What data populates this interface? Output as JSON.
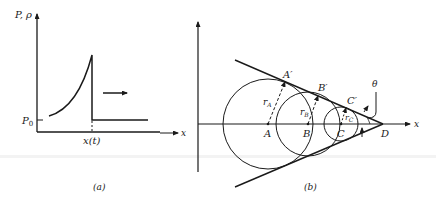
{
  "figure": {
    "panel_a": {
      "caption": "(a)",
      "y_axis_label": "P, ρ",
      "x_axis_label": "x",
      "baseline_label": "P",
      "baseline_subscript": "0",
      "front_position_label": "x(t)",
      "direction_arrow": "arrow-right-icon",
      "description": "Pressure/density profile rising from P0 to a peak, then sharp drop at shock front x(t) back to P0; arrow indicates propagation to the right"
    },
    "panel_b": {
      "caption": "(b)",
      "x_axis_label": "x",
      "points": [
        "A",
        "B",
        "C",
        "D"
      ],
      "tangent_points": [
        "A′",
        "B′",
        "C′"
      ],
      "radii": [
        {
          "label": "r",
          "sub": "A"
        },
        {
          "label": "r",
          "sub": "B"
        },
        {
          "label": "r",
          "sub": "C"
        }
      ],
      "angle_label": "θ",
      "description": "Circles centered at A, B, C on the x axis with radii rA, rB, rC, all tangent to two lines converging at D at half-angle θ"
    },
    "colors": {
      "ink": "#1a1a1a",
      "background": "#ffffff"
    }
  }
}
